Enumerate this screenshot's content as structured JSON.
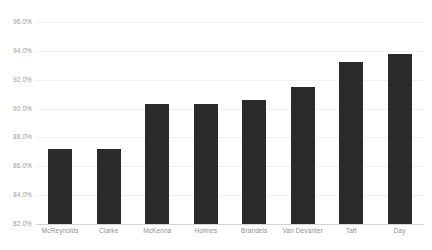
{
  "chart_data": {
    "type": "bar",
    "title": "",
    "subtitle": "",
    "xlabel": "",
    "ylabel": "",
    "ylim": [
      82.0,
      96.0
    ],
    "ytick_step": 2.0,
    "ytick_labels": [
      "96.0%",
      "94.0%",
      "92.0%",
      "90.0%",
      "88.0%",
      "86.0%",
      "84.0%",
      "82.0%"
    ],
    "ytick_values": [
      96.0,
      94.0,
      92.0,
      90.0,
      88.0,
      86.0,
      84.0,
      82.0
    ],
    "grid": true,
    "grid_axis": "y",
    "legend": false,
    "legend_position": "none",
    "value_format": "percent",
    "categories": [
      "McReynolds",
      "Clarke",
      "McKenna",
      "Holmes",
      "Brandeis",
      "Van Devanter",
      "Taft",
      "Day"
    ],
    "values": [
      87.2,
      87.2,
      90.3,
      90.3,
      90.6,
      91.5,
      93.2,
      93.8
    ],
    "value_labels": [
      "87.2%",
      "87.2%",
      "90.3%",
      "90.3%",
      "90.6%",
      "91.5%",
      "93.2%",
      "93.8%"
    ],
    "bar_color": "#2b2b2b",
    "gridline_color": "#f2f2f2",
    "axis_color": "#d4d4d4",
    "tick_label_color": "#9a9a9a",
    "annotations": []
  }
}
